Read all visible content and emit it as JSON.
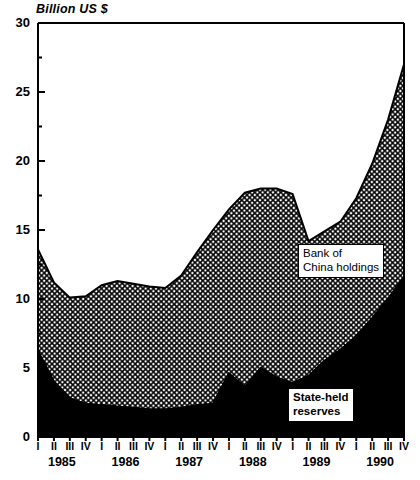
{
  "axis_title": "Billion US $",
  "y_ticks_labeled": [
    "30",
    "25",
    "20",
    "15",
    "10",
    "5",
    "0"
  ],
  "annotations": {
    "upper": {
      "line1": "Bank of",
      "line2": "China holdings"
    },
    "lower": {
      "line1": "State-held",
      "line2": "reserves"
    }
  },
  "years": [
    "1985",
    "1986",
    "1987",
    "1988",
    "1989",
    "1990"
  ],
  "quarters": [
    "I",
    "II",
    "III",
    "IV"
  ],
  "colors": {
    "state_held_reserves": "#000000",
    "bank_of_china_holdings": "#ffffff",
    "axis": "#000000",
    "background": "#ffffff"
  },
  "chart_data": {
    "type": "area",
    "title": "",
    "subtitle": "",
    "xlabel": "",
    "ylabel": "Billion US $",
    "ylim": [
      0,
      30
    ],
    "ytick_step_labeled": 5,
    "ytick_step_minor": 2.5,
    "grid": false,
    "legend": "in-plot annotations",
    "stacked": true,
    "categories": [
      "1985 I",
      "1985 II",
      "1985 III",
      "1985 IV",
      "1986 I",
      "1986 II",
      "1986 III",
      "1986 IV",
      "1987 I",
      "1987 II",
      "1987 III",
      "1987 IV",
      "1988 I",
      "1988 II",
      "1988 III",
      "1988 IV",
      "1989 I",
      "1989 II",
      "1989 III",
      "1989 IV",
      "1990 I",
      "1990 II",
      "1990 III",
      "1990 IV"
    ],
    "series": [
      {
        "name": "State-held reserves",
        "fill": "solid-black",
        "values": [
          6.2,
          4.0,
          2.8,
          2.4,
          2.3,
          2.2,
          2.1,
          2.0,
          2.0,
          2.1,
          2.3,
          2.4,
          4.6,
          3.6,
          5.0,
          4.3,
          3.9,
          4.4,
          5.5,
          6.3,
          7.3,
          8.6,
          10.0,
          11.6
        ]
      },
      {
        "name": "Bank of China holdings",
        "fill": "crosshatch",
        "values": [
          7.4,
          7.2,
          7.3,
          7.8,
          8.7,
          9.1,
          9.0,
          8.9,
          8.8,
          9.6,
          11.1,
          12.6,
          11.9,
          14.1,
          13.0,
          13.7,
          13.7,
          9.8,
          9.4,
          9.3,
          10.0,
          11.2,
          13.0,
          15.4
        ]
      }
    ],
    "totals": [
      13.6,
      11.2,
      10.1,
      10.2,
      11.0,
      11.3,
      11.1,
      10.9,
      10.8,
      11.7,
      13.4,
      15.0,
      16.5,
      17.7,
      18.0,
      18.0,
      17.6,
      14.2,
      14.9,
      15.6,
      17.3,
      19.8,
      23.0,
      27.0
    ]
  }
}
